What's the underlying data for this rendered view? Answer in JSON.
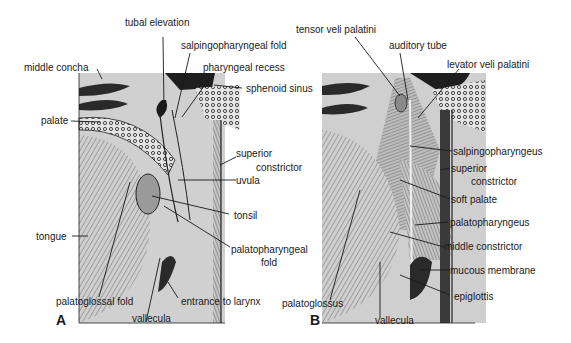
{
  "figure": {
    "panels": [
      {
        "letter": "A",
        "labels": {
          "tubal_elevation": "tubal elevation",
          "salpingopharyngeal_fold": "salpingopharyngeal fold",
          "middle_concha": "middle concha",
          "pharyngeal_recess": "pharyngeal recess",
          "sphenoid_sinus": "sphenoid sinus",
          "palate": "palate",
          "superior": "superior",
          "constrictor": "constrictor",
          "uvula": "uvula",
          "tonsil": "tonsil",
          "tongue": "tongue",
          "palatopharyngeal": "palatopharyngeal",
          "fold": "fold",
          "palatoglossal_fold": "palatoglossal fold",
          "entrance_to_larynx": "entrance to larynx",
          "vallecula": "vallecula"
        }
      },
      {
        "letter": "B",
        "labels": {
          "tensor_veli_palatini": "tensor veli palatini",
          "auditory_tube": "auditory tube",
          "levator_veli_palatini": "levator veli palatini",
          "salpingopharyngeus": "salpingopharyngeus",
          "superior": "superior",
          "constrictor": "constrictor",
          "soft_palate": "soft palate",
          "palatopharyngeus": "palatopharyngeus",
          "middle_constrictor": "middle constrictor",
          "mucous_membrane": "mucous membrane",
          "epiglottis": "epiglottis",
          "palatoglossus": "palatoglossus",
          "vallecula": "vallecula"
        }
      }
    ]
  },
  "colors": {
    "tissue_light": "#d6d6d6",
    "tissue_mid": "#b4b4b4",
    "tissue_dark": "#2a2a2a",
    "ink": "#1a1a1a"
  }
}
